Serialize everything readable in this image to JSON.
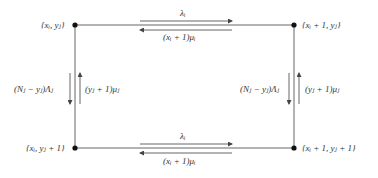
{
  "diagram": {
    "type": "state-transition",
    "nodes": {
      "top_left": {
        "label": "{x_i, y_j}",
        "display": "{xᵢ, yⱼ}",
        "x": 75,
        "y": 25
      },
      "top_right": {
        "label": "{x_i + 1, y_j}",
        "display": "{xᵢ + 1, yⱼ}",
        "x": 294,
        "y": 25
      },
      "bottom_left": {
        "label": "{x_i, y_j + 1}",
        "display": "{xᵢ, yⱼ + 1}",
        "x": 75,
        "y": 148
      },
      "bottom_right": {
        "label": "{x_i + 1, y_j + 1}",
        "display": "{xᵢ + 1, yⱼ + 1}",
        "x": 294,
        "y": 148
      }
    },
    "edges": {
      "top_forward": {
        "label": "λ_i",
        "display": "λᵢ"
      },
      "top_backward": {
        "label": "(x_i + 1)μ_i",
        "display": "(xᵢ + 1)μᵢ"
      },
      "bottom_forward": {
        "label": "λ_i",
        "display": "λᵢ"
      },
      "bottom_backward": {
        "label": "(x_i + 1)μ_i",
        "display": "(xᵢ + 1)μᵢ"
      },
      "left_down": {
        "label": "(N_j − y_j)Λ_j",
        "display": "(Nⱼ − yⱼ)Λⱼ"
      },
      "left_up": {
        "label": "(y_j + 1)μ_j",
        "display": "(yⱼ + 1)μⱼ"
      },
      "right_down": {
        "label": "(N_j − y_j)Λ_j",
        "display": "(Nⱼ − yⱼ)Λⱼ"
      },
      "right_up": {
        "label": "(y_j + 1)μ_j",
        "display": "(yⱼ + 1)μⱼ"
      }
    },
    "colors": {
      "line": "#555555",
      "dot": "#111111",
      "text": "#333333"
    }
  }
}
